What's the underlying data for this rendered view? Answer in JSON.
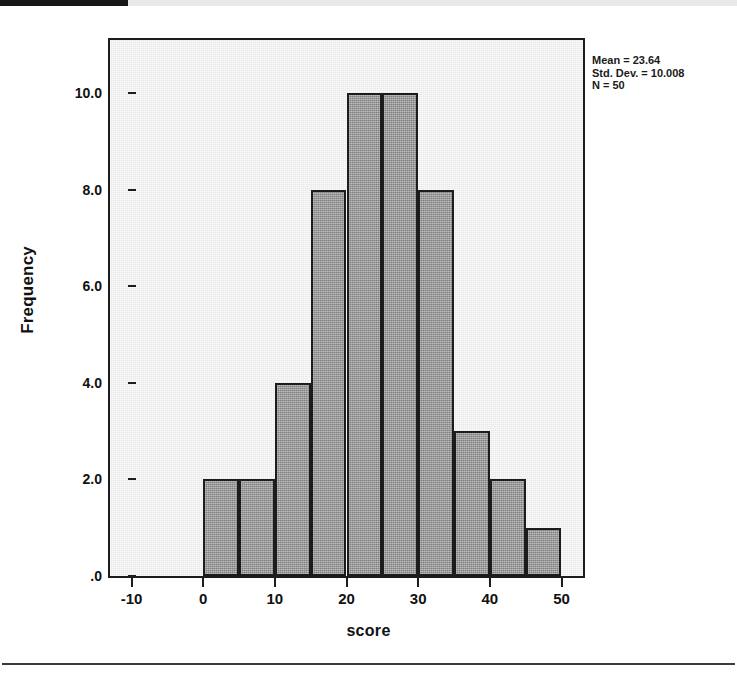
{
  "page": {
    "background_color": "#ffffff",
    "top_strip_color": "#e9e9e9",
    "black_tab_color": "#161616",
    "bottom_rule_color": "#3a3a3a"
  },
  "figure": {
    "plot_background_color": "#e8e8e8",
    "bar_fill_color": "#9a9a9a",
    "bar_border_color": "#1c1c1c",
    "frame_color": "#1c1c1c"
  },
  "stats": {
    "mean_label": "Mean = 23.64",
    "std_dev_label": "Std. Dev. = 10.008",
    "n_label": "N = 50"
  },
  "chart_data": {
    "type": "bar",
    "title": "",
    "subtitle": "",
    "xlabel": "score",
    "ylabel": "Frequency",
    "xlim": [
      -13,
      53
    ],
    "ylim": [
      0,
      11.1
    ],
    "grid": false,
    "legend": false,
    "legend_position": "none",
    "bin_width": 5,
    "bin_edges": [
      0,
      5,
      10,
      15,
      20,
      25,
      30,
      35,
      40,
      45,
      50
    ],
    "categories": [
      "0-5",
      "5-10",
      "10-15",
      "15-20",
      "20-25",
      "25-30",
      "30-35",
      "35-40",
      "40-45",
      "45-50"
    ],
    "bin_centers": [
      2.5,
      7.5,
      12.5,
      17.5,
      22.5,
      27.5,
      32.5,
      37.5,
      42.5,
      47.5
    ],
    "values": [
      2,
      2,
      4,
      8,
      10,
      10,
      8,
      3,
      2,
      1
    ],
    "xticks": [
      -10,
      0,
      10,
      20,
      30,
      40,
      50
    ],
    "xtick_labels": [
      "-10",
      "0",
      "10",
      "20",
      "30",
      "40",
      "50"
    ],
    "yticks": [
      0,
      2,
      4,
      6,
      8,
      10
    ],
    "ytick_labels": [
      ".0",
      "2.0",
      "4.0",
      "6.0",
      "8.0",
      "10.0"
    ],
    "annotations": [
      "Mean = 23.64",
      "Std. Dev. = 10.008",
      "N = 50"
    ],
    "statistics": {
      "mean": 23.64,
      "std_dev": 10.008,
      "n": 50
    }
  }
}
